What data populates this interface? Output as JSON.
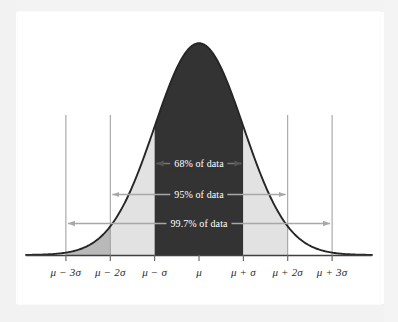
{
  "figure": {
    "name": "normal-distribution-empirical-rule"
  },
  "chart_data": {
    "type": "area",
    "title": "",
    "subtitle": "",
    "xlabel": "",
    "ylabel": "",
    "grid": true,
    "legend_position": "none",
    "distribution": "normal",
    "mean": 0,
    "sd": 1,
    "xlim": [
      -3.9,
      3.9
    ],
    "ylim": [
      0,
      0.42
    ],
    "x_tick_values": [
      -3,
      -2,
      -1,
      0,
      1,
      2,
      3
    ],
    "x_tick_labels": [
      "μ − 3σ",
      "μ − 2σ",
      "μ − σ",
      "μ",
      "μ + σ",
      "μ + 2σ",
      "μ + 3σ"
    ],
    "annotations": [
      {
        "label": "68% of data",
        "from": -1,
        "to": 1,
        "sigma_span": 1,
        "value_percent": 68,
        "text_color": "#ffffff",
        "arrow_color": "#555555"
      },
      {
        "label": "95% of data",
        "from": -2,
        "to": 2,
        "sigma_span": 2,
        "value_percent": 95,
        "text_color": "#232323",
        "arrow_color": "#a8a8a8"
      },
      {
        "label": "99.7% of data",
        "from": -3,
        "to": 3,
        "sigma_span": 3,
        "value_percent": 99.7,
        "text_color": "#232323",
        "arrow_color": "#a8a8a8"
      }
    ],
    "regions": [
      {
        "name": "core-1sigma",
        "from": -1,
        "to": 1,
        "fill": "#333333"
      },
      {
        "name": "left-1-2-sigma",
        "from": -2,
        "to": -1,
        "fill": "#e2e2e2"
      },
      {
        "name": "right-1-2-sigma",
        "from": 1,
        "to": 2,
        "fill": "#e2e2e2"
      },
      {
        "name": "left-2-3-sigma",
        "from": -3,
        "to": -2,
        "fill": "#b9b9b9"
      }
    ],
    "series": [
      {
        "name": "normal-pdf",
        "stroke": "#262626",
        "x": [
          -3.9,
          -3.6,
          -3.3,
          -3.0,
          -2.7,
          -2.4,
          -2.1,
          -1.8,
          -1.5,
          -1.2,
          -0.9,
          -0.6,
          -0.3,
          0.0,
          0.3,
          0.6,
          0.9,
          1.2,
          1.5,
          1.8,
          2.1,
          2.4,
          2.7,
          3.0,
          3.3,
          3.6,
          3.9
        ],
        "values": [
          0.0002,
          0.0006,
          0.0017,
          0.0044,
          0.0104,
          0.0224,
          0.044,
          0.079,
          0.1295,
          0.1942,
          0.2661,
          0.3332,
          0.3814,
          0.3989,
          0.3814,
          0.3332,
          0.2661,
          0.1942,
          0.1295,
          0.079,
          0.044,
          0.0224,
          0.0104,
          0.0044,
          0.0017,
          0.0006,
          0.0002
        ]
      }
    ]
  },
  "colors": {
    "curve": "#262626",
    "core_fill": "#333333",
    "mid_fill": "#e2e2e2",
    "outer_fill": "#b9b9b9",
    "axis": "#4a4a4a",
    "gridline": "#9a9a9a",
    "arrow_light": "#a8a8a8",
    "arrow_dark": "#555555",
    "background": "#ffffff"
  }
}
